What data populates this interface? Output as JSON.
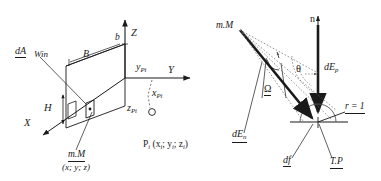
{
  "figure": {
    "panels": [
      {
        "id": "left-panel",
        "name": "3D coordinate system with window aperture",
        "axes": [
          {
            "name": "Z",
            "label": "Z",
            "direction": "up"
          },
          {
            "name": "Y",
            "label": "Y",
            "direction": "right"
          },
          {
            "name": "X",
            "label": "X",
            "direction": "lower-left"
          }
        ],
        "labels": {
          "dA": "dA",
          "win": "Win",
          "B": "B",
          "b": "b",
          "H": "H",
          "mM": "m.M",
          "mM_coords": "(x; y; z)",
          "y_p": "y",
          "y_p_sub": "Pi",
          "x_p": "x",
          "x_p_sub": "Pi",
          "z_p": "z",
          "z_p_sub": "Pi",
          "point_P": "P",
          "point_P_sub": "i",
          "point_P_coords": "(x",
          "point_P_full": "P i (x i; y i; z i)"
        }
      },
      {
        "id": "right-panel",
        "name": "Hemisphere illuminance geometry",
        "labels": {
          "n": "n",
          "mM": "m.M",
          "theta": "θ",
          "omega": "Ω",
          "dE_p": "dE",
          "dE_p_sub": "p",
          "dE_n": "dE",
          "dE_n_sub": "n",
          "r_eq": "r = 1",
          "df": "df",
          "TP": "T.P"
        }
      }
    ],
    "colors": {
      "stroke": "#1a1a1a",
      "light_stroke": "#8a8a8a",
      "background": "#ffffff"
    }
  }
}
